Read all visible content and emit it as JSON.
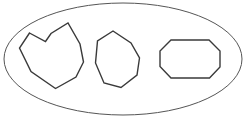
{
  "figure": {
    "type": "geometry-diagram",
    "canvas": {
      "width": 246,
      "height": 131
    },
    "background_color": "#ffffff",
    "stroke_color": "#3a3a3a",
    "fill_color": "#ffffff",
    "container": {
      "name": "ellipse",
      "shape": "ellipse",
      "center_x": 123,
      "center_y": 59,
      "radius_x": 119,
      "radius_y": 56,
      "stroke_width": 1
    },
    "shapes": [
      {
        "name": "concave-polygon",
        "label": "Left concave polygon",
        "vertex_count": 9,
        "stroke_width": 1.4,
        "points": "29.5,33 45.5,41.5 51,33.5 68,23 80,44 83.5,62 76,77 55.5,88.5 31,71.5 19.5,48"
      },
      {
        "name": "convex-heptagon",
        "label": "Middle convex heptagon",
        "vertex_count": 8,
        "stroke_width": 1.4,
        "points": "113,31 131,43 139.5,58 137,75 121,87.5 104,83 95.5,63 97.5,41"
      },
      {
        "name": "elongated-octagon",
        "label": "Right elongated octagon",
        "vertex_count": 8,
        "stroke_width": 1.4,
        "points": "171,40 209,40 220,51 220,67 209.5,78 171,78 160,66.5 160,51"
      }
    ]
  }
}
